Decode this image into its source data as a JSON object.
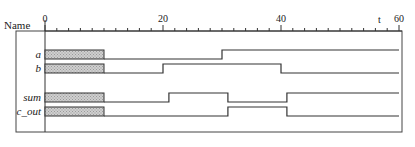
{
  "header": {
    "name_label": "Name",
    "time_label": "t"
  },
  "axis": {
    "t_min": 0,
    "t_max": 60,
    "major_ticks": [
      0,
      20,
      40,
      60
    ],
    "major_tick_labels": [
      "0",
      "20",
      "40",
      "60"
    ],
    "minor_tick_step": 2
  },
  "undefined_region": {
    "t_start": 0,
    "t_end": 10,
    "fill": "hatched"
  },
  "signals": [
    {
      "name": "a",
      "label": "a",
      "transitions": [
        [
          10,
          0
        ],
        [
          30,
          1
        ]
      ]
    },
    {
      "name": "b",
      "label": "b",
      "transitions": [
        [
          10,
          0
        ],
        [
          20,
          1
        ],
        [
          40,
          0
        ]
      ]
    },
    {
      "name": "sum",
      "label": "sum",
      "transitions": [
        [
          10,
          0
        ],
        [
          21,
          1
        ],
        [
          31,
          0
        ],
        [
          41,
          1
        ]
      ]
    },
    {
      "name": "c_out",
      "label": "c_out",
      "transitions": [
        [
          10,
          0
        ],
        [
          31,
          1
        ],
        [
          41,
          0
        ]
      ]
    }
  ],
  "colors": {
    "line": "#333333",
    "border": "#444444",
    "hatch": "#bdbdbd"
  }
}
